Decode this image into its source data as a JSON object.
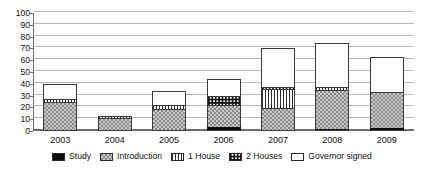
{
  "chart_data": {
    "type": "bar",
    "stacked": true,
    "title": "",
    "xlabel": "",
    "ylabel": "",
    "ylim": [
      0,
      100
    ],
    "ytick_step": 10,
    "yticks": [
      0,
      10,
      20,
      30,
      40,
      50,
      60,
      70,
      80,
      90,
      100
    ],
    "grid": true,
    "legend_position": "bottom",
    "categories": [
      "2003",
      "2004",
      "2005",
      "2006",
      "2007",
      "2008",
      "2009"
    ],
    "series": [
      {
        "name": "Study",
        "pattern": "solid-black",
        "values": [
          0,
          0,
          0,
          3,
          0,
          1,
          2.5
        ]
      },
      {
        "name": "Introduction",
        "pattern": "fine-dots",
        "values": [
          25,
          11,
          19,
          19,
          19.5,
          33,
          30.5
        ]
      },
      {
        "name": "1 House",
        "pattern": "vertical-lines",
        "values": [
          2,
          2,
          3,
          0,
          16,
          3,
          0
        ]
      },
      {
        "name": "2 Houses",
        "pattern": "checker-dots",
        "values": [
          0,
          0,
          0,
          8,
          1.5,
          0,
          0
        ]
      },
      {
        "name": "Governor signed",
        "pattern": "white",
        "values": [
          13,
          0,
          12,
          14.5,
          33.5,
          36.5,
          30
        ]
      }
    ],
    "totals": [
      40,
      13,
      34,
      44.5,
      70.5,
      73.5,
      63
    ]
  },
  "legend": {
    "items": [
      {
        "label": "Study"
      },
      {
        "label": "Introduction"
      },
      {
        "label": "1 House"
      },
      {
        "label": "2 Houses"
      },
      {
        "label": "Governor signed"
      }
    ]
  },
  "colors": {
    "axis": "#6e6e6e",
    "grid": "#b8b8b8",
    "study": "#0d0d0d",
    "introduction": "#c9c9c9",
    "outline": "#3a3a3a",
    "governor_signed": "#ffffff",
    "text": "#111111"
  }
}
